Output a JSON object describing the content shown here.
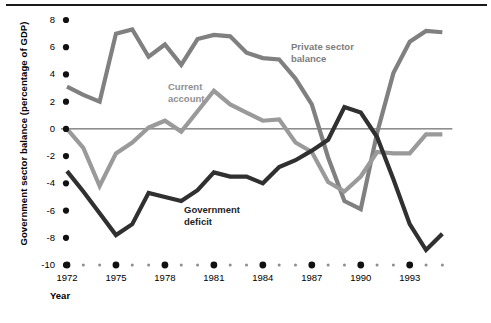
{
  "chart_data": {
    "type": "line",
    "title": "",
    "xlabel": "Year",
    "ylabel": "Government sector balance (percentage of GDP)",
    "xlim": [
      1972,
      1995
    ],
    "ylim": [
      -10,
      8
    ],
    "ytick_values": [
      8,
      6,
      4,
      2,
      0,
      -2,
      -4,
      -6,
      -8,
      -10
    ],
    "ytick_labels": [
      "8",
      "6",
      "4",
      "2",
      "0",
      "-2",
      "-4",
      "-6",
      "-8",
      "-10"
    ],
    "xtick_values": [
      1972,
      1975,
      1978,
      1981,
      1984,
      1987,
      1990,
      1993
    ],
    "xtick_labels": [
      "1972",
      "1975",
      "1978",
      "1981",
      "1984",
      "1987",
      "1990",
      "1993"
    ],
    "minor_xtick_values": [
      1973,
      1974,
      1976,
      1977,
      1979,
      1980,
      1982,
      1983,
      1985,
      1986,
      1988,
      1989,
      1991,
      1992,
      1994,
      1995
    ],
    "grid": false,
    "legend_position": "inline-annotations",
    "zero_line": 0,
    "x": [
      1972,
      1973,
      1974,
      1975,
      1976,
      1977,
      1978,
      1979,
      1980,
      1981,
      1982,
      1983,
      1984,
      1985,
      1986,
      1987,
      1988,
      1989,
      1990,
      1991,
      1992,
      1993,
      1994,
      1995
    ],
    "series": [
      {
        "name": "Private sector balance",
        "color": "#808080",
        "values": [
          3.1,
          2.5,
          2.0,
          7.0,
          7.3,
          5.3,
          6.2,
          4.7,
          6.6,
          6.9,
          6.8,
          5.6,
          5.2,
          5.1,
          3.7,
          1.8,
          -2.1,
          -5.3,
          -5.9,
          -0.3,
          4.1,
          6.4,
          7.2,
          7.1
        ]
      },
      {
        "name": "Current account",
        "color": "#9a9a9a",
        "values": [
          0.0,
          -1.4,
          -4.2,
          -1.8,
          -1.0,
          0.1,
          0.6,
          -0.2,
          1.3,
          2.8,
          1.8,
          1.2,
          0.6,
          0.7,
          -1.0,
          -1.7,
          -3.9,
          -4.6,
          -3.5,
          -1.7,
          -1.8,
          -1.8,
          -0.4,
          -0.4
        ]
      },
      {
        "name": "Government deficit",
        "color": "#303030",
        "values": [
          -3.1,
          -4.6,
          -6.2,
          -7.8,
          -7.0,
          -4.7,
          -5.0,
          -5.3,
          -4.5,
          -3.2,
          -3.5,
          -3.5,
          -4.0,
          -2.8,
          -2.3,
          -1.6,
          -0.8,
          1.6,
          1.2,
          -0.6,
          -3.7,
          -7.0,
          -8.9,
          -7.7
        ]
      }
    ],
    "annotations": [
      {
        "text": "Private sector\nbalance",
        "series": "Private sector balance",
        "x_px": 291,
        "y_px": 41
      },
      {
        "text": "Current\naccount",
        "series": "Current account",
        "x_px": 168,
        "y_px": 81
      },
      {
        "text": "Government\ndeficit",
        "series": "Government deficit",
        "x_px": 184,
        "y_px": 204
      }
    ]
  }
}
